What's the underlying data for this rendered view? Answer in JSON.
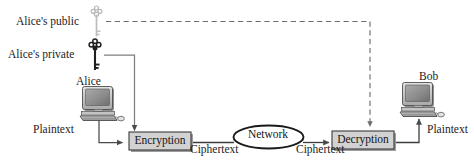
{
  "diagram": {
    "keys": [
      {
        "id": "alices-public-key",
        "label": "Alice's public",
        "icon": "key-icon",
        "color": "#b9b9b9",
        "style": "light-gray"
      },
      {
        "id": "alices-private-key",
        "label": "Alice's private",
        "icon": "key-icon",
        "color": "#1a1a1a",
        "style": "black"
      }
    ],
    "actors": [
      {
        "id": "alice",
        "label": "Alice",
        "icon": "desktop-computer-icon"
      },
      {
        "id": "bob",
        "label": "Bob",
        "icon": "desktop-computer-icon"
      }
    ],
    "process_boxes": [
      {
        "id": "encryption",
        "label": "Encryption",
        "fill": "#d2d2d2",
        "stroke": "#3a3a3a"
      },
      {
        "id": "decryption",
        "label": "Decryption",
        "fill": "#d2d2d2",
        "stroke": "#3a3a3a"
      }
    ],
    "network": {
      "id": "network",
      "label": "Network",
      "fill": "#ffffff",
      "stroke": "#1a1a1a"
    },
    "flow_labels": {
      "plaintext_left": "Plaintext",
      "plaintext_right": "Plaintext",
      "ciphertext_left": "Ciphertext",
      "ciphertext_right": "Ciphertext"
    },
    "edges": [
      {
        "id": "private-key-to-encryption",
        "from": "alices-private-key",
        "to": "encryption",
        "style": "solid",
        "arrow": "end"
      },
      {
        "id": "public-key-to-decryption",
        "from": "alices-public-key",
        "to": "decryption",
        "style": "dashed",
        "arrow": "end"
      },
      {
        "id": "alice-to-encryption",
        "from": "alice",
        "to": "encryption",
        "label": "Plaintext",
        "style": "solid",
        "arrow": "end"
      },
      {
        "id": "encryption-to-network",
        "from": "encryption",
        "to": "network",
        "label": "Ciphertext",
        "style": "solid",
        "arrow": "none"
      },
      {
        "id": "network-to-decryption",
        "from": "network",
        "to": "decryption",
        "label": "Ciphertext",
        "style": "solid",
        "arrow": "end"
      },
      {
        "id": "decryption-to-bob",
        "from": "decryption",
        "to": "bob",
        "label": "Plaintext",
        "style": "solid",
        "arrow": "end"
      }
    ],
    "colors": {
      "line": "#4a4a4a",
      "text": "#1c1c1c",
      "box_fill": "#d2d2d2",
      "box_stroke": "#3a3a3a",
      "shadow": "#9a9a9a",
      "monitor_screen": "#8f8f8f",
      "monitor_body": "#c9c9c9"
    }
  }
}
